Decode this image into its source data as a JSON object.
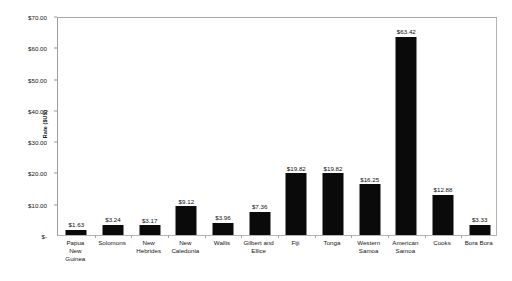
{
  "chart_data": {
    "type": "bar",
    "title": "",
    "subtitle": "",
    "xlabel": "",
    "ylabel": "Rate ($US)",
    "ylim": [
      0,
      70
    ],
    "ytick_values": [
      0,
      10,
      20,
      30,
      40,
      50,
      60,
      70
    ],
    "ytick_labels": [
      "$-",
      "$10.00",
      "$20.00",
      "$30.00",
      "$40.00",
      "$50.00",
      "$60.00",
      "$70.00"
    ],
    "grid": false,
    "legend": false,
    "legend_position": "none",
    "bar_color": "#0a0a0a",
    "plot_border_color": "#b4b4b4",
    "background_color": "#ffffff",
    "categories": [
      "Papua New Guinea",
      "Solomons",
      "New Hebrides",
      "New Caledonia",
      "Wallis",
      "Gilbert and Ellice",
      "Fiji",
      "Tonga",
      "Western Samoa",
      "American Samoa",
      "Cooks",
      "Bora Bora"
    ],
    "category_label_lines": [
      [
        "Papua",
        "New",
        "Guinea"
      ],
      [
        "Solomons"
      ],
      [
        "New",
        "Hebrides"
      ],
      [
        "New",
        "Caledonia"
      ],
      [
        "Wallis"
      ],
      [
        "Gilbert and",
        "Ellice"
      ],
      [
        "Fiji"
      ],
      [
        "Tonga"
      ],
      [
        "Western",
        "Samoa"
      ],
      [
        "American",
        "Samoa"
      ],
      [
        "Cooks"
      ],
      [
        "Bora Bora"
      ]
    ],
    "values": [
      1.63,
      3.24,
      3.17,
      9.12,
      3.96,
      7.36,
      19.82,
      19.82,
      16.25,
      63.42,
      12.88,
      3.33
    ],
    "value_labels": [
      "$1.63",
      "$3.24",
      "$3.17",
      "$9.12",
      "$3.96",
      "$7.36",
      "$19.82",
      "$19.82",
      "$16.25",
      "$63.42",
      "$12.88",
      "$3.33"
    ]
  }
}
